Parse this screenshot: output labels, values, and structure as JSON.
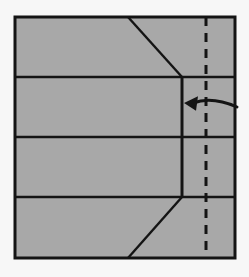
{
  "diagram": {
    "title": "Origami fold step diagram",
    "canvas": {
      "width": 249,
      "height": 277,
      "background_color": "#f7f7f7"
    },
    "paper": {
      "name": "paper-square",
      "fill_color": "#a8a8a8",
      "stroke_color": "#141414",
      "stroke_width": 3,
      "left": 15,
      "top": 17,
      "right": 235,
      "bottom": 258
    },
    "crease_lines": {
      "stroke_color": "#141414",
      "stroke_width": 2.4,
      "horizontal": [
        {
          "name": "horizontal-crease-1",
          "y": 77,
          "x1": 15,
          "x2": 235
        },
        {
          "name": "horizontal-crease-2",
          "y": 137,
          "x1": 15,
          "x2": 235
        },
        {
          "name": "horizontal-crease-3",
          "y": 197,
          "x1": 15,
          "x2": 235
        }
      ],
      "vertical": [
        {
          "name": "vertical-edge",
          "x": 182,
          "y1": 77,
          "y2": 197,
          "stroke_width": 3
        }
      ],
      "diagonals": [
        {
          "name": "diagonal-top",
          "x1": 128,
          "y1": 17,
          "x2": 182,
          "y2": 77
        },
        {
          "name": "diagonal-bottom",
          "x1": 182,
          "y1": 197,
          "x2": 128,
          "y2": 258
        }
      ]
    },
    "fold_line": {
      "name": "dash-dot-fold-line",
      "x": 206,
      "y1": 17,
      "y2": 258,
      "stroke_color": "#141414",
      "stroke_width": 3,
      "dash_pattern": "9 7",
      "style": "dashed"
    },
    "arrow": {
      "name": "fold-direction-arrow",
      "direction": "left",
      "stroke_color": "#141414",
      "stroke_width": 3,
      "tail_x": 237,
      "tail_y": 107,
      "head_x": 184,
      "head_y": 103,
      "curve_control_x": 212,
      "curve_control_y": 96,
      "head_size": 11
    }
  }
}
